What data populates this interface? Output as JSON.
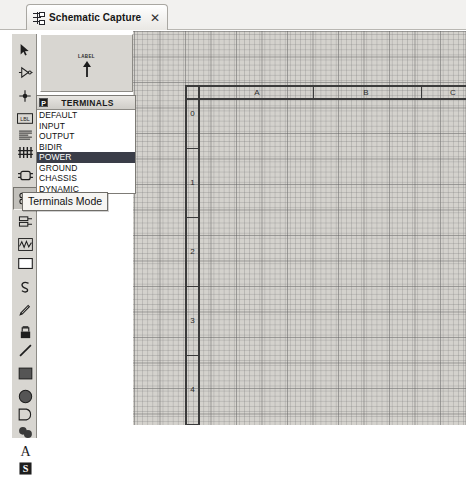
{
  "window": {
    "tab": {
      "label": "Schematic Capture",
      "close_label": "✕",
      "icon": "schematic-capture-icon"
    }
  },
  "toolbar": {
    "name": "mode-toolbar",
    "items": [
      {
        "id": "selection",
        "icon": "cursor-arrow-icon",
        "tooltip": "Selection Mode",
        "selected": false,
        "top": 4
      },
      {
        "id": "component",
        "icon": "component-icon",
        "tooltip": "Component Mode",
        "selected": false,
        "top": 27
      },
      {
        "id": "junction-dot",
        "icon": "junction-dot-icon",
        "tooltip": "Junction Dot Mode",
        "selected": false,
        "top": 50
      },
      {
        "id": "wire-label",
        "icon": "wire-label-icon",
        "tooltip": "Wire Label Mode",
        "selected": false,
        "top": 73
      },
      {
        "id": "text-script",
        "icon": "text-script-icon",
        "tooltip": "Text Script Mode",
        "selected": false,
        "top": 90
      },
      {
        "id": "buses",
        "icon": "buses-icon",
        "tooltip": "Buses Mode",
        "selected": false,
        "top": 107
      },
      {
        "id": "subcircuit",
        "icon": "subcircuit-icon",
        "tooltip": "Sub-circuit Mode",
        "selected": false,
        "top": 130
      },
      {
        "id": "terminals",
        "icon": "terminals-icon",
        "tooltip": "Terminals Mode",
        "selected": true,
        "top": 153
      },
      {
        "id": "device-pins",
        "icon": "device-pin-icon",
        "tooltip": "Device Pins Mode",
        "selected": false,
        "top": 176
      },
      {
        "id": "graph",
        "icon": "graph-icon",
        "tooltip": "Graph Mode",
        "selected": false,
        "top": 199
      },
      {
        "id": "tape-recorder",
        "icon": "tape-recorder-icon",
        "tooltip": "Tape Recorder Mode",
        "selected": false,
        "top": 218
      },
      {
        "id": "generator",
        "icon": "generator-icon",
        "tooltip": "Generator Mode",
        "selected": false,
        "top": 241
      },
      {
        "id": "voltage-probe",
        "icon": "voltage-probe-icon",
        "tooltip": "Voltage Probe Mode",
        "selected": false,
        "top": 264
      },
      {
        "id": "virtual-instrument",
        "icon": "virtual-instrument-icon",
        "tooltip": "Virtual Instruments",
        "selected": false,
        "top": 287
      },
      {
        "id": "2d-line",
        "icon": "line-icon",
        "tooltip": "2D Graphics Line",
        "selected": false,
        "top": 305
      },
      {
        "id": "2d-box",
        "icon": "rectangle-icon",
        "tooltip": "2D Graphics Box",
        "selected": false,
        "top": 328
      },
      {
        "id": "2d-circle",
        "icon": "circle-icon",
        "tooltip": "2D Graphics Circle",
        "selected": false,
        "top": 351
      },
      {
        "id": "2d-arc",
        "icon": "arc-icon",
        "tooltip": "2D Graphics Arc",
        "selected": false,
        "top": 369
      },
      {
        "id": "2d-path",
        "icon": "closed-path-icon",
        "tooltip": "2D Graphics Path",
        "selected": false,
        "top": 387
      },
      {
        "id": "2d-text",
        "icon": "text-icon",
        "tooltip": "2D Graphics Text",
        "selected": false,
        "top": 405
      },
      {
        "id": "2d-symbol",
        "icon": "symbol-icon",
        "tooltip": "2D Graphics Symbol",
        "selected": false,
        "top": 423
      }
    ]
  },
  "tooltip": {
    "text": "Terminals Mode"
  },
  "preview": {
    "name": "symbol-preview",
    "label": "LABEL",
    "symbol": "power-terminal-icon"
  },
  "terminals_panel": {
    "header_icon": "P",
    "title": "TERMINALS",
    "items": [
      {
        "label": "DEFAULT",
        "selected": false
      },
      {
        "label": "INPUT",
        "selected": false
      },
      {
        "label": "OUTPUT",
        "selected": false
      },
      {
        "label": "BIDIR",
        "selected": false
      },
      {
        "label": "POWER",
        "selected": true
      },
      {
        "label": "GROUND",
        "selected": false
      },
      {
        "label": "CHASSIS",
        "selected": false
      },
      {
        "label": "DYNAMIC",
        "selected": false
      }
    ],
    "selected": "POWER",
    "selection_bg": "#3a3d48",
    "selection_fg": "#ffffff"
  },
  "schematic": {
    "name": "schematic-canvas",
    "grid_visible": true,
    "grid_color": "#787878",
    "sheet_border_color": "#3b3b3b",
    "column_labels": [
      "A",
      "B",
      "C"
    ],
    "column_positions": [
      124,
      233,
      320
    ],
    "column_separators": [
      180,
      288
    ],
    "row_labels": [
      "0",
      "1",
      "2",
      "3",
      "4"
    ],
    "row_positions": [
      83,
      152,
      221,
      290,
      359
    ],
    "row_separators": [
      117,
      186,
      255,
      324,
      393
    ]
  }
}
